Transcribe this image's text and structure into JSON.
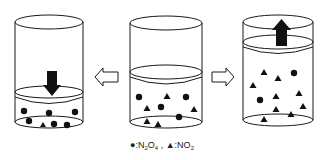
{
  "diagram": {
    "title": "",
    "cylinders": [
      {
        "id": "compressed",
        "position": "left",
        "piston_arrow": "down",
        "particles": {
          "N2O4_circles": 7,
          "NO2_triangles": 1
        }
      },
      {
        "id": "initial",
        "position": "center",
        "piston_arrow": "none",
        "particles": {
          "N2O4_circles": 5,
          "NO2_triangles": 6
        }
      },
      {
        "id": "expanded",
        "position": "right",
        "piston_arrow": "up",
        "particles": {
          "N2O4_circles": 2,
          "NO2_triangles": 10
        }
      }
    ],
    "transitions": [
      {
        "from": "initial",
        "to": "compressed",
        "arrow": "hollow-left"
      },
      {
        "from": "initial",
        "to": "expanded",
        "arrow": "hollow-right"
      }
    ]
  },
  "legend": {
    "circle_symbol": "●",
    "circle_label_prefix": ":N",
    "circle_sub1": "2",
    "circle_mid": "O",
    "circle_sub2": "4",
    "separator": " , ",
    "triangle_symbol": "▲",
    "triangle_label_prefix": ":NO",
    "triangle_sub": "2"
  },
  "colors": {
    "stroke": "#1a1a1a",
    "fill": "#111111",
    "background": "#ffffff"
  }
}
